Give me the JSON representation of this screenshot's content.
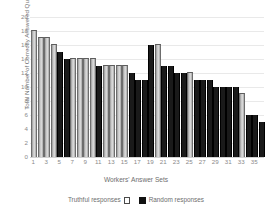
{
  "chart_data": {
    "type": "bar",
    "title": "",
    "xlabel": "Workers' Answer Sets",
    "ylabel": "Total Number of Correctly Answered Questions",
    "ylim": [
      0,
      20
    ],
    "yticks": [
      20,
      18,
      16,
      14,
      12,
      10,
      8,
      6,
      4,
      2,
      0
    ],
    "grid": true,
    "legend_position": "bottom",
    "categories": [
      "1",
      "2",
      "3",
      "4",
      "5",
      "6",
      "7",
      "8",
      "9",
      "10",
      "11",
      "12",
      "13",
      "14",
      "15",
      "16",
      "17",
      "18",
      "19",
      "20",
      "21",
      "22",
      "23",
      "24",
      "25",
      "26",
      "27",
      "28",
      "29",
      "30",
      "31",
      "32",
      "33",
      "34",
      "35",
      "36"
    ],
    "xtick_labels": [
      "1",
      "3",
      "5",
      "7",
      "9",
      "11",
      "13",
      "15",
      "17",
      "19",
      "21",
      "23",
      "25",
      "27",
      "29",
      "31",
      "33",
      "35"
    ],
    "values": [
      18,
      17,
      17,
      16,
      15,
      14,
      14,
      14,
      14,
      14,
      13,
      13,
      13,
      13,
      13,
      12,
      11,
      11,
      16,
      16,
      13,
      13,
      12,
      12,
      12,
      11,
      11,
      11,
      10,
      10,
      10,
      10,
      9,
      6,
      6,
      5
    ],
    "series_assignment": [
      "truthful",
      "truthful",
      "truthful",
      "truthful",
      "random",
      "random",
      "truthful",
      "truthful",
      "truthful",
      "truthful",
      "random",
      "truthful",
      "truthful",
      "truthful",
      "truthful",
      "random",
      "random",
      "random",
      "random",
      "truthful",
      "random",
      "random",
      "random",
      "random",
      "truthful",
      "random",
      "random",
      "random",
      "random",
      "random",
      "random",
      "random",
      "truthful",
      "random",
      "random",
      "random"
    ],
    "series": [
      {
        "name": "Truthful responses",
        "marker": "hollow-square",
        "color": "#d0d0d0",
        "edge_color": "#6d6d6d"
      },
      {
        "name": "Random responses",
        "marker": "filled-square",
        "color": "#1a1a1a",
        "edge_color": "#000000"
      }
    ]
  },
  "legend": {
    "truthful_label": "Truthful responses",
    "random_label": "Random responses"
  }
}
